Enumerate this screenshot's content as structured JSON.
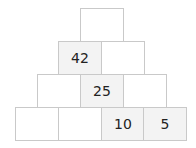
{
  "pyramid": {
    "rows": [
      {
        "cells": [
          {
            "value": ""
          }
        ]
      },
      {
        "cells": [
          {
            "value": "42"
          },
          {
            "value": ""
          }
        ]
      },
      {
        "cells": [
          {
            "value": ""
          },
          {
            "value": "25"
          },
          {
            "value": ""
          }
        ]
      },
      {
        "cells": [
          {
            "value": ""
          },
          {
            "value": ""
          },
          {
            "value": "10"
          },
          {
            "value": "5"
          }
        ]
      }
    ]
  },
  "colors": {
    "border": "#c9c9c9",
    "filled_bg": "#f3f3f3",
    "empty_bg": "#ffffff",
    "text": "#222222"
  }
}
